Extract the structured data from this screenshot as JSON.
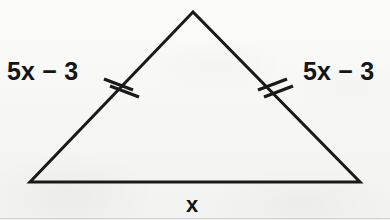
{
  "figure": {
    "name": "isosceles-triangle-with-congruent-side-marks",
    "background_color": "#f8f8f7",
    "stroke_color": "#1a1a1a",
    "text_color": "#151515",
    "stroke_width": 3
  },
  "triangle": {
    "vertices": {
      "apex": {
        "x": 193,
        "y": 12
      },
      "bottom_left": {
        "x": 30,
        "y": 182
      },
      "bottom_right": {
        "x": 360,
        "y": 182
      }
    },
    "points_attr": "193,12 30,182 360,182"
  },
  "tick_marks": {
    "count_per_side": 2,
    "left": [
      {
        "x1": 104,
        "y1": 79,
        "x2": 133,
        "y2": 90
      },
      {
        "x1": 110,
        "y1": 86,
        "x2": 139,
        "y2": 97
      }
    ],
    "right": [
      {
        "x1": 258,
        "y1": 90,
        "x2": 287,
        "y2": 79
      },
      {
        "x1": 264,
        "y1": 97,
        "x2": 293,
        "y2": 86
      }
    ]
  },
  "labels": {
    "left_side": "5x − 3",
    "right_side": "5x − 3",
    "base": "x"
  }
}
